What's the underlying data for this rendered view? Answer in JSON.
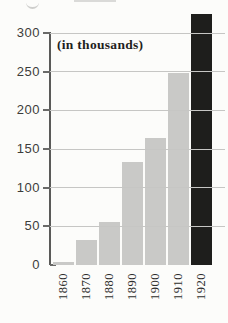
{
  "figure": {
    "annotation": "(in thousands)"
  },
  "chart_data": {
    "type": "bar",
    "title": "",
    "subtitle": "",
    "annotation": "(in thousands)",
    "xlabel": "",
    "ylabel": "",
    "categories": [
      "1860",
      "1870",
      "1880",
      "1890",
      "1900",
      "1910",
      "1920"
    ],
    "values": [
      4,
      32,
      56,
      133,
      164,
      248,
      324
    ],
    "bar_styles": [
      "gray",
      "gray",
      "gray",
      "gray",
      "gray",
      "gray",
      "black"
    ],
    "yticks": [
      0,
      50,
      100,
      150,
      200,
      250,
      300
    ],
    "ylim": [
      0,
      330
    ],
    "grid": true,
    "legend": false,
    "colors": {
      "gray_bar": "#c9c9c7",
      "black_bar": "#1e1e1c",
      "gridline": "#c6c6c4",
      "axis": "#5a5a58",
      "tick_text": "#3c3c3a",
      "category_text": "#2e2e2c",
      "background": "#fcfcfa"
    }
  }
}
